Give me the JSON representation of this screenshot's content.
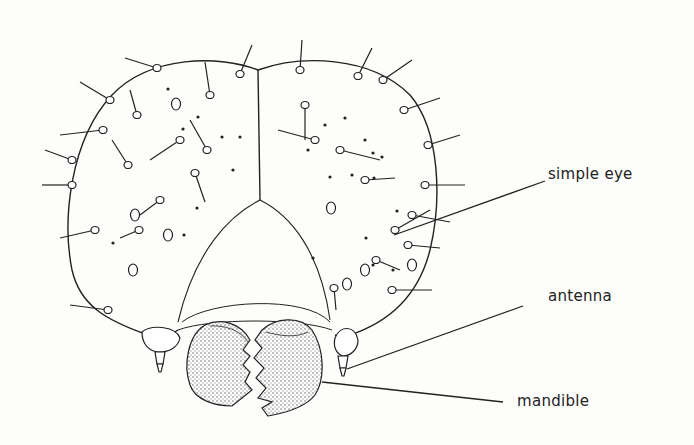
{
  "figure": {
    "labels": [
      {
        "id": "simple-eye",
        "text": "simple eye",
        "x": 548,
        "y": 165,
        "line": [
          394,
          235,
          545,
          181
        ]
      },
      {
        "id": "antenna",
        "text": "antenna",
        "x": 548,
        "y": 287,
        "line": [
          347,
          369,
          523,
          306
        ]
      },
      {
        "id": "mandible",
        "text": "mandible",
        "x": 517,
        "y": 392,
        "line": [
          322,
          382,
          503,
          402
        ]
      }
    ],
    "colors": {
      "ink": "#222222",
      "paper": "#fdfdfb",
      "stipple": "#555555"
    }
  }
}
